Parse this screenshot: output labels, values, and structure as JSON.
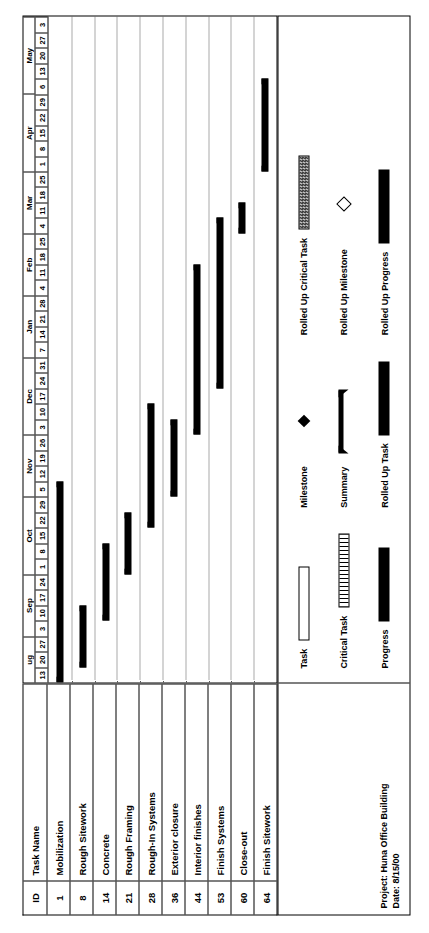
{
  "project": {
    "title_line": "Project: Huna Office Building",
    "date_line": "Date: 8/15/00"
  },
  "table": {
    "headers": {
      "id": "ID",
      "name": "Task Name"
    },
    "rows": [
      {
        "id": "1",
        "name": "Mobilization"
      },
      {
        "id": "8",
        "name": "Rough Sitework"
      },
      {
        "id": "14",
        "name": "Concrete"
      },
      {
        "id": "21",
        "name": "Rough Framing"
      },
      {
        "id": "28",
        "name": "Rough-In Systems"
      },
      {
        "id": "36",
        "name": "Exterior closure"
      },
      {
        "id": "44",
        "name": "Interior finishes"
      },
      {
        "id": "53",
        "name": "Finish Systems"
      },
      {
        "id": "60",
        "name": "Close-out"
      },
      {
        "id": "64",
        "name": "Finish Sitework"
      }
    ]
  },
  "legend": {
    "columns": [
      {
        "items": [
          {
            "label": "Task",
            "symbol": "open-bar"
          },
          {
            "label": "Critical Task",
            "symbol": "hatched-bar"
          },
          {
            "label": "Progress",
            "symbol": "solid-bar"
          }
        ]
      },
      {
        "items": [
          {
            "label": "Milestone",
            "symbol": "filled-diamond"
          },
          {
            "label": "Summary",
            "symbol": "summary-bar"
          },
          {
            "label": "Rolled Up Task",
            "symbol": "dotted-bar"
          }
        ]
      },
      {
        "items": [
          {
            "label": "Rolled Up Critical Task",
            "symbol": "dotted-bar-outlined"
          },
          {
            "label": "Rolled Up Milestone",
            "symbol": "hollow-diamond"
          },
          {
            "label": "Rolled Up Progress",
            "symbol": "solid-bar"
          }
        ]
      }
    ]
  },
  "chart_data": {
    "type": "bar",
    "xlabel": "",
    "ylabel": "",
    "orientation": "gantt-horizontal",
    "timescale": {
      "unit": "week",
      "start": "Aug 13",
      "end": "May 3",
      "months": [
        {
          "label": "ug",
          "weeks": [
            "13",
            "20",
            "27"
          ]
        },
        {
          "label": "Sep",
          "weeks": [
            "3",
            "10",
            "17",
            "24"
          ]
        },
        {
          "label": "Oct",
          "weeks": [
            "1",
            "8",
            "15",
            "22",
            "29"
          ]
        },
        {
          "label": "Nov",
          "weeks": [
            "5",
            "12",
            "19",
            "26"
          ]
        },
        {
          "label": "Dec",
          "weeks": [
            "3",
            "10",
            "17",
            "24",
            "31"
          ]
        },
        {
          "label": "Jan",
          "weeks": [
            "7",
            "14",
            "21",
            "28"
          ]
        },
        {
          "label": "Feb",
          "weeks": [
            "4",
            "11",
            "18",
            "25"
          ]
        },
        {
          "label": "Mar",
          "weeks": [
            "4",
            "11",
            "18",
            "25"
          ]
        },
        {
          "label": "Apr",
          "weeks": [
            "1",
            "8",
            "15",
            "22",
            "29"
          ]
        },
        {
          "label": "May",
          "weeks": [
            "6",
            "13",
            "20",
            "27",
            "3"
          ]
        }
      ],
      "total_weeks": 39
    },
    "categories": [
      "Mobilization",
      "Rough Sitework",
      "Concrete",
      "Rough Framing",
      "Rough-In Systems",
      "Exterior closure",
      "Interior finishes",
      "Finish Systems",
      "Close-out",
      "Finish Sitework"
    ],
    "bars": [
      {
        "task": "Mobilization",
        "id": "1",
        "start_week": 0,
        "end_week": 13,
        "style": "summary"
      },
      {
        "task": "Rough Sitework",
        "id": "8",
        "start_week": 1,
        "end_week": 5,
        "style": "summary"
      },
      {
        "task": "Concrete",
        "id": "14",
        "start_week": 4,
        "end_week": 9,
        "style": "summary"
      },
      {
        "task": "Rough Framing",
        "id": "21",
        "start_week": 7,
        "end_week": 11,
        "style": "summary"
      },
      {
        "task": "Rough-In Systems",
        "id": "28",
        "start_week": 10,
        "end_week": 18,
        "style": "summary"
      },
      {
        "task": "Exterior closure",
        "id": "36",
        "start_week": 12,
        "end_week": 17,
        "style": "summary"
      },
      {
        "task": "Interior finishes",
        "id": "44",
        "start_week": 16,
        "end_week": 27,
        "style": "summary"
      },
      {
        "task": "Finish Systems",
        "id": "53",
        "start_week": 19,
        "end_week": 30,
        "style": "summary"
      },
      {
        "task": "Close-out",
        "id": "60",
        "start_week": 29,
        "end_week": 31,
        "style": "summary"
      },
      {
        "task": "Finish Sitework",
        "id": "64",
        "start_week": 33,
        "end_week": 39,
        "style": "summary"
      }
    ]
  }
}
